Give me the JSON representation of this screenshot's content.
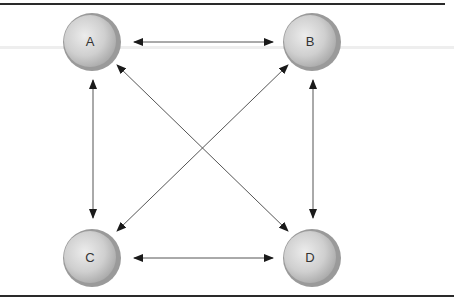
{
  "diagram": {
    "type": "fully-connected network",
    "nodes": [
      {
        "id": "A",
        "label": "A",
        "cx": 92,
        "cy": 42
      },
      {
        "id": "B",
        "label": "B",
        "cx": 312,
        "cy": 42
      },
      {
        "id": "C",
        "label": "C",
        "cx": 92,
        "cy": 258
      },
      {
        "id": "D",
        "label": "D",
        "cx": 312,
        "cy": 258
      }
    ],
    "edges": [
      {
        "from": "A",
        "to": "B",
        "bidirectional": true
      },
      {
        "from": "A",
        "to": "C",
        "bidirectional": true
      },
      {
        "from": "A",
        "to": "D",
        "bidirectional": true
      },
      {
        "from": "B",
        "to": "C",
        "bidirectional": true
      },
      {
        "from": "B",
        "to": "D",
        "bidirectional": true
      },
      {
        "from": "C",
        "to": "D",
        "bidirectional": true
      }
    ],
    "colors": {
      "border": "#2a2a2a",
      "arrow": "#555555",
      "node_fill_light": "#e2e2e2",
      "node_fill_dark": "#a8a8a8",
      "node_rim": "#9a9a9a"
    }
  }
}
